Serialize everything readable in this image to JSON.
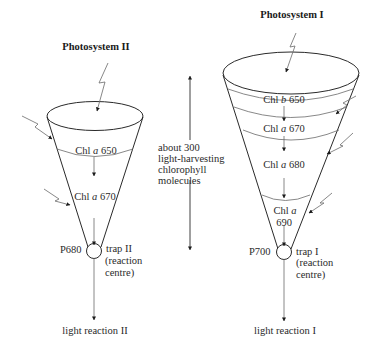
{
  "diagram": {
    "type": "photosystem-antenna-funnel",
    "colors": {
      "line": "#2a2a2a",
      "thin_line": "#6a6a6a",
      "text": "#2a2a2a",
      "background": "#ffffff"
    },
    "photosystem_ii": {
      "title": "Photosystem II",
      "layers": [
        {
          "prefix": "Chl ",
          "letter": "a",
          "suffix": " 650"
        },
        {
          "prefix": "Chl ",
          "letter": "a",
          "suffix": " 670"
        }
      ],
      "reaction_centre_pigment": "P680",
      "trap_label_line1": "trap II",
      "trap_label_line2": "(reaction",
      "trap_label_line3": "centre)",
      "output_label": "light reaction II"
    },
    "photosystem_i": {
      "title": "Photosystem I",
      "layers": [
        {
          "prefix": "Chl ",
          "letter": "b",
          "suffix": " 650"
        },
        {
          "prefix": "Chl ",
          "letter": "a",
          "suffix": " 670"
        },
        {
          "prefix": "Chl ",
          "letter": "a",
          "suffix": " 680"
        },
        {
          "prefix": "Chl ",
          "letter": "a",
          "suffix": "",
          "line2": "690"
        }
      ],
      "reaction_centre_pigment": "P700",
      "trap_label_line1": "trap I",
      "trap_label_line2": "(reaction",
      "trap_label_line3": "centre)",
      "output_label": "light reaction I"
    },
    "middle_annotation": {
      "line1": "about 300",
      "line2": "light-harvesting",
      "line3": "chlorophyll",
      "line4": "molecules"
    },
    "icons": {
      "light_input": "lightning-arrow-icon",
      "energy_flow": "down-arrow-icon",
      "trap": "circle-trap-icon"
    }
  }
}
